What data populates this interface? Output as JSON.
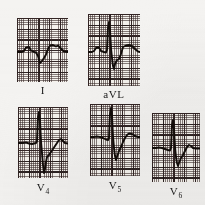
{
  "figure": {
    "type": "ecg-strip",
    "background_color": "#f4f3f1",
    "grid_color": "#3c2d2d",
    "trace_color": "#1a1512"
  },
  "panels": [
    {
      "id": "lead-i",
      "label": "I",
      "label_sub": "",
      "x": 17,
      "y": 18,
      "width": 51,
      "height": 64,
      "label_x": 33,
      "label_y": 85,
      "label_w": 20,
      "baseline": 0.54,
      "trace": "M0,34 L5,34 L7,33 L9,29.5 L12,29 L14,32.5 L17,34 L19,34.5 L21,38 L23,45 L25,43 L27,40 L29,36.5 L31,31 L33,27.5 L36,27 L39,28.5 L41,27.5 L44,30.5 L47,33.5 L51,34 L51,34"
    },
    {
      "id": "lead-avl",
      "label": "aVL",
      "label_sub": "",
      "x": 88,
      "y": 14,
      "width": 52,
      "height": 72,
      "label_x": 95,
      "label_y": 89,
      "label_w": 38,
      "baseline": 0.52,
      "trace": "M0,38 L4,38 L6,37 L8,34 L11,33.5 L13,37 L16,38 L18,38.5 L19,36 L20,14 L21,8 L22,16 L23,34 L24,44 L25,52 L26,55 L27,50 L29,46 L31,45 L33,40 L35,33 L38,31.5 L41,31 L44,32 L47,35 L50,37.5 L52,38"
    },
    {
      "id": "lead-v4",
      "label": "V",
      "label_sub": "4",
      "x": 18,
      "y": 107,
      "width": 50,
      "height": 71,
      "label_x": 31,
      "label_y": 182,
      "label_w": 24,
      "baseline": 0.5,
      "trace": "M0,36 L5,36 L8,35.5 L11,36.5 L14,37 L16,36.5 L18,36 L19,34 L20,10 L21,5 L22,14 L23,34 L24,46 L25,58 L26,66 L27,62 L28,55 L29,50 L31,48 L33,45 L35,42 L37,39 L39,36 L41,33 L43,32 L45,34 L47,36 L50,36.5"
    },
    {
      "id": "lead-v5",
      "label": "V",
      "label_sub": "5",
      "x": 90,
      "y": 104,
      "width": 50,
      "height": 72,
      "label_x": 103,
      "label_y": 180,
      "label_w": 24,
      "baseline": 0.47,
      "trace": "M0,33 L4,33 L7,32.5 L10,33 L13,34 L16,35.5 L18,36 L19,34 L20,10 L21,4 L22,13 L23,32 L24,44 L25,52 L26,56 L27,53 L29,47 L31,43 L33,38 L35,34 L37,31 L39,29.5 L42,30 L45,32 L48,33 L50,33"
    },
    {
      "id": "lead-v6",
      "label": "V",
      "label_sub": "6",
      "x": 152,
      "y": 113,
      "width": 48,
      "height": 69,
      "label_x": 164,
      "label_y": 186,
      "label_w": 24,
      "baseline": 0.52,
      "trace": "M0,35 L4,35 L7,34.5 L10,35 L13,36 L16,37 L18,37.5 L19,35 L20,12 L21,7 L22,16 L23,34 L24,44 L25,50 L26,53 L27,50 L29,45 L31,42 L33,38 L35,34 L37,32 L39,33 L41,35 L44,35.5 L48,35.5"
    }
  ]
}
